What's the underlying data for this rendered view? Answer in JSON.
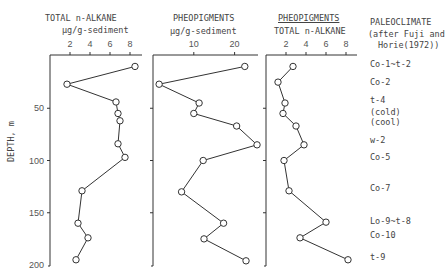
{
  "chart_data": [
    {
      "type": "line",
      "title": "TOTAL n-ALKANE",
      "xlabel": "µg/g-sediment",
      "ylabel": "DEPTH, m",
      "x_ticks": [
        2,
        4,
        6,
        8
      ],
      "y_ticks": [
        50,
        100,
        150,
        200
      ],
      "xlim": [
        0,
        9
      ],
      "ylim": [
        200,
        0
      ],
      "orientation": "x-top, depth increasing downward",
      "points": [
        {
          "depth": 10,
          "value": 8.5
        },
        {
          "depth": 27,
          "value": 1.7
        },
        {
          "depth": 44,
          "value": 6.6
        },
        {
          "depth": 55,
          "value": 6.8
        },
        {
          "depth": 62,
          "value": 7.0
        },
        {
          "depth": 84,
          "value": 6.8
        },
        {
          "depth": 97,
          "value": 7.5
        },
        {
          "depth": 129,
          "value": 3.2
        },
        {
          "depth": 160,
          "value": 2.8
        },
        {
          "depth": 174,
          "value": 3.8
        },
        {
          "depth": 195,
          "value": 2.6
        }
      ]
    },
    {
      "type": "line",
      "title": "PHEOPIGMENTS",
      "xlabel": "µg/g-sediment",
      "x_ticks": [
        10,
        20
      ],
      "y_ticks": [
        50,
        100,
        150,
        200
      ],
      "xlim": [
        0,
        25
      ],
      "ylim": [
        200,
        0
      ],
      "points": [
        {
          "depth": 10,
          "value": 22.5
        },
        {
          "depth": 27,
          "value": 1.5
        },
        {
          "depth": 45,
          "value": 11.3
        },
        {
          "depth": 55,
          "value": 10.0
        },
        {
          "depth": 67,
          "value": 20.5
        },
        {
          "depth": 85,
          "value": 25.5
        },
        {
          "depth": 100,
          "value": 12.3
        },
        {
          "depth": 130,
          "value": 7.0
        },
        {
          "depth": 160,
          "value": 17.3
        },
        {
          "depth": 175,
          "value": 12.5
        },
        {
          "depth": 196,
          "value": 22.8
        }
      ]
    },
    {
      "type": "line",
      "title": "PHEOPIGMENTS / TOTAL n-ALKANE",
      "xlabel": "",
      "x_ticks": [
        2,
        4,
        6,
        8
      ],
      "y_ticks": [
        50,
        100,
        150,
        200
      ],
      "xlim": [
        0,
        9
      ],
      "ylim": [
        200,
        0
      ],
      "points": [
        {
          "depth": 10,
          "value": 2.7
        },
        {
          "depth": 25,
          "value": 1.2
        },
        {
          "depth": 45,
          "value": 1.9
        },
        {
          "depth": 55,
          "value": 1.7
        },
        {
          "depth": 67,
          "value": 3.0
        },
        {
          "depth": 85,
          "value": 3.8
        },
        {
          "depth": 100,
          "value": 1.8
        },
        {
          "depth": 129,
          "value": 2.3
        },
        {
          "depth": 159,
          "value": 6.0
        },
        {
          "depth": 174,
          "value": 3.4
        },
        {
          "depth": 195,
          "value": 8.2
        }
      ]
    }
  ],
  "headers": {
    "panel1_title": "TOTAL n-ALKANE",
    "panel1_unit": "µg/g-sediment",
    "panel2_title": "PHEOPIGMENTS",
    "panel2_unit": "µg/g-sediment",
    "panel3_numerator": "PHEOPIGMENTS",
    "panel3_denominator": "TOTAL n-ALKANE",
    "paleo_title": "PALEOCLIMATE",
    "paleo_sub1": "(after Fuji and",
    "paleo_sub2": "Horie(1972))",
    "y_axis_label": "DEPTH, m"
  },
  "ticks": {
    "p1": [
      "2",
      "4",
      "6",
      "8"
    ],
    "p2": [
      "10",
      "20"
    ],
    "p3": [
      "2",
      "4",
      "6",
      "8"
    ],
    "depth": [
      "50",
      "100",
      "150",
      "200"
    ]
  },
  "paleoclimate": [
    {
      "label": "Co-1~t-2",
      "y": 65
    },
    {
      "label": "Co-2",
      "y": 83
    },
    {
      "label": "t-4",
      "y": 101
    },
    {
      "label": "(cold)",
      "y": 113
    },
    {
      "label": "(cool)",
      "y": 123
    },
    {
      "label": "w-2",
      "y": 141
    },
    {
      "label": "Co-5",
      "y": 158
    },
    {
      "label": "Co-7",
      "y": 189
    },
    {
      "label": "Lo-9~t-8",
      "y": 222
    },
    {
      "label": "Co-10",
      "y": 236
    },
    {
      "label": "t-9",
      "y": 258
    }
  ]
}
